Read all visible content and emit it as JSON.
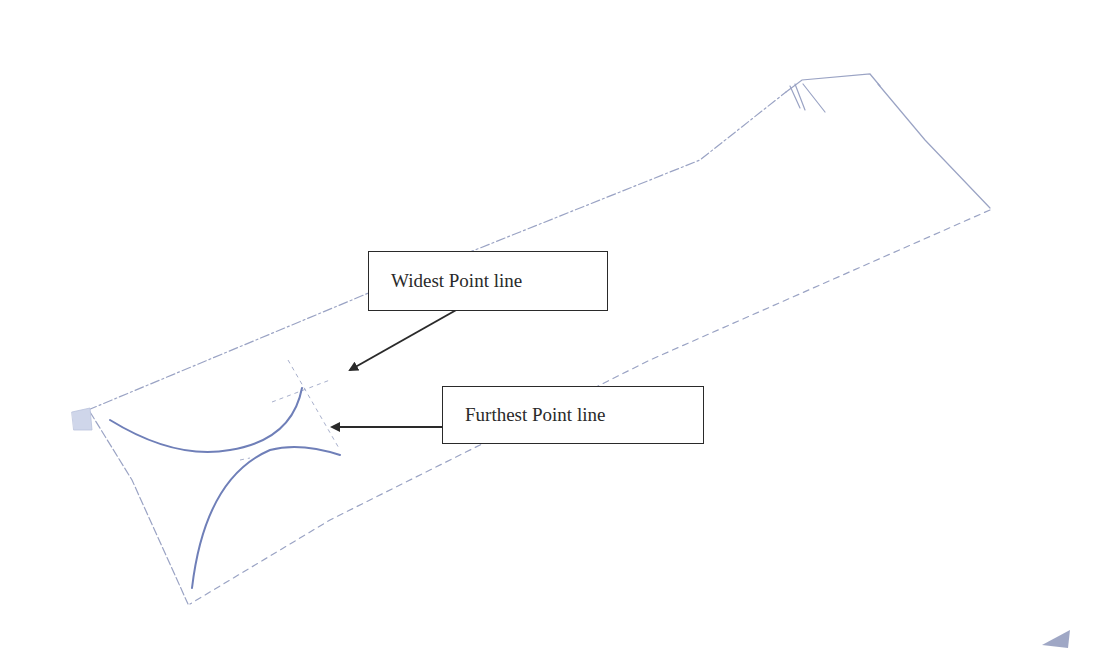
{
  "diagram": {
    "type": "scanned pencil sketch",
    "colors": {
      "background": "#ffffff",
      "sketch_line": "#9aa3c4",
      "curve_ink": "#6f7fb8",
      "callout_border": "#2a2a2a",
      "arrow": "#2a2a2a",
      "text": "#2a2a2a"
    },
    "callouts": [
      {
        "id": "widest",
        "label": "Widest Point line",
        "box": {
          "x": 368,
          "y": 251,
          "w": 240,
          "h": 60
        },
        "arrow": {
          "from": [
            458,
            309
          ],
          "to": [
            350,
            370
          ]
        }
      },
      {
        "id": "furthest",
        "label": "Furthest Point line",
        "box": {
          "x": 442,
          "y": 386,
          "w": 262,
          "h": 58
        },
        "arrow": {
          "from": [
            442,
            427
          ],
          "to": [
            332,
            427
          ]
        }
      }
    ]
  }
}
